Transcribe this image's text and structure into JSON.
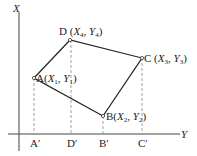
{
  "diagram": {
    "axes": {
      "vertical_label": "X",
      "horizontal_label": "Y"
    },
    "points": [
      {
        "name": "A",
        "xvar": "X",
        "xsub": "1",
        "yvar": "Y",
        "ysub": "1",
        "proj": "A′"
      },
      {
        "name": "B",
        "xvar": "X",
        "xsub": "2",
        "yvar": "Y",
        "ysub": "2",
        "proj": "B′"
      },
      {
        "name": "C",
        "xvar": "X",
        "xsub": "3",
        "yvar": "Y",
        "ysub": "3",
        "proj": "C′"
      },
      {
        "name": "D",
        "xvar": "X",
        "xsub": "4",
        "yvar": "Y",
        "ysub": "4",
        "proj": "D′"
      }
    ],
    "polygon_order": [
      "A",
      "D",
      "C",
      "B"
    ],
    "colors": {
      "line": "#222222",
      "dash": "#888888"
    }
  }
}
